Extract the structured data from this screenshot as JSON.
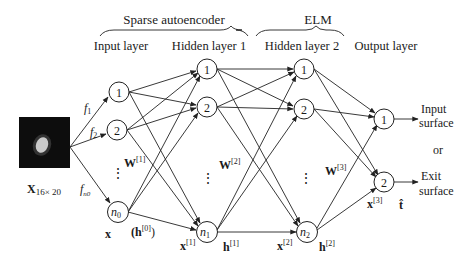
{
  "groups": {
    "sparse_autoencoder": "Sparse autoencoder",
    "elm": "ELM"
  },
  "layers": {
    "input": "Input layer",
    "hidden1": "Hidden layer 1",
    "hidden2": "Hidden layer 2",
    "output": "Output layer"
  },
  "input_image": {
    "label_main": "X",
    "label_sub": "16× 20"
  },
  "features": [
    "f",
    "1",
    "f",
    "2",
    "f",
    "n0"
  ],
  "nodes": {
    "input": [
      "1",
      "2",
      "n",
      "0"
    ],
    "hidden1": [
      "1",
      "2",
      "n",
      "1"
    ],
    "hidden2": [
      "1",
      "2",
      "n",
      "2"
    ],
    "output": [
      "1",
      "2"
    ]
  },
  "vectors": {
    "x": "x",
    "h0_open": "(h",
    "h0_sup": "[0]",
    "h0_close": ")",
    "x1": "x",
    "x1_sup": "[1]",
    "h1": "h",
    "h1_sup": "[1]",
    "x2": "x",
    "x2_sup": "[2]",
    "h2": "h",
    "h2_sup": "[2]",
    "x3": "x",
    "x3_sup": "[3]",
    "t_hat": "t̂"
  },
  "weights": {
    "w1": "W",
    "w1_sup": "[1]",
    "w2": "W",
    "w2_sup": "[2]",
    "w3": "W",
    "w3_sup": "[3]"
  },
  "ellipsis": "⋮",
  "outputs": {
    "out1_line1": "Input",
    "out1_line2": "surface",
    "or": "or",
    "out2_line1": "Exit",
    "out2_line2": "surface"
  }
}
